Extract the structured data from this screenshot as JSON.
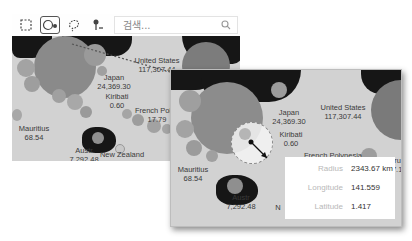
{
  "toolbar": {
    "tools": [
      {
        "name": "rectangle-select",
        "active": false
      },
      {
        "name": "radius-select",
        "active": true
      },
      {
        "name": "lasso-select",
        "active": false
      },
      {
        "name": "pin-select",
        "active": false
      }
    ],
    "search_placeholder": "검색..."
  },
  "map_back": {
    "labels": [
      {
        "name": "United States",
        "value": "117,307.44"
      },
      {
        "name": "Japan",
        "value": "24,369.30"
      },
      {
        "name": "Kiribati",
        "value": "0.60"
      },
      {
        "name": "French Polyn",
        "value": "17.79"
      },
      {
        "name": "Mauritius",
        "value": "68.54"
      },
      {
        "name": "Austr",
        "value": "7,292.48"
      },
      {
        "name": "New Zealand",
        "value": "739.67"
      }
    ]
  },
  "map_front": {
    "labels": [
      {
        "name": "Japan",
        "value": "24,369.30"
      },
      {
        "name": "United States",
        "value": "117,307.44"
      },
      {
        "name": "Kiribati",
        "value": "0.60"
      },
      {
        "name": "French Polynesia",
        "value": "17.79"
      },
      {
        "name": "Peru",
        "value": "577.1"
      },
      {
        "name": "Mauritius",
        "value": "68.54"
      },
      {
        "name": "Austr",
        "value": "7,292.48"
      },
      {
        "name": "N",
        "value": ""
      }
    ]
  },
  "radius_info": {
    "rows": [
      {
        "key": "Radius",
        "value": "2343.67 km"
      },
      {
        "key": "Longitude",
        "value": "141.559"
      },
      {
        "key": "Latitude",
        "value": "1.417"
      }
    ]
  }
}
